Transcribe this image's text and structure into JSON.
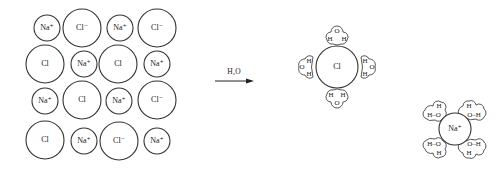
{
  "figure": {
    "lattice": {
      "rows": [
        [
          {
            "label": "Na⁺",
            "kind": "small"
          },
          {
            "label": "Cl⁻",
            "kind": "big"
          },
          {
            "label": "Na⁺",
            "kind": "small"
          },
          {
            "label": "Cl⁻",
            "kind": "big"
          }
        ],
        [
          {
            "label": "Cl",
            "kind": "big"
          },
          {
            "label": "Na⁺",
            "kind": "small"
          },
          {
            "label": "Cl",
            "kind": "big"
          },
          {
            "label": "Na⁺",
            "kind": "small"
          }
        ],
        [
          {
            "label": "Na⁺",
            "kind": "small"
          },
          {
            "label": "Cl",
            "kind": "big"
          },
          {
            "label": "Na⁺",
            "kind": "small"
          },
          {
            "label": "Cl⁻",
            "kind": "big"
          }
        ],
        [
          {
            "label": "Cl",
            "kind": "big"
          },
          {
            "label": "Na⁺",
            "kind": "small"
          },
          {
            "label": "Cl⁻",
            "kind": "big"
          },
          {
            "label": "Na⁺",
            "kind": "small"
          }
        ]
      ]
    },
    "arrow": {
      "label": "H₂O"
    },
    "hydrated_chloride": {
      "ion_label": "Cl",
      "waters": [
        {
          "position": "top",
          "atoms": [
            "H",
            "O",
            "H"
          ]
        },
        {
          "position": "left",
          "atoms": [
            "H",
            "O",
            "H"
          ]
        },
        {
          "position": "right",
          "atoms": [
            "H",
            "O",
            "H"
          ]
        },
        {
          "position": "bottom",
          "atoms": [
            "H",
            "O",
            "H"
          ]
        }
      ]
    },
    "hydrated_sodium": {
      "ion_label": "Na⁺",
      "waters": [
        {
          "position": "top-left",
          "text_top": "H",
          "text_bottom": "H–O"
        },
        {
          "position": "top-right",
          "text_top": "H",
          "text_bottom": "O–H"
        },
        {
          "position": "bottom-left",
          "text_top": "H–O",
          "text_bottom": "H"
        },
        {
          "position": "bottom-right",
          "text_top": "O–H",
          "text_bottom": "H"
        }
      ]
    },
    "atom_labels": {
      "H": "H",
      "O": "O"
    }
  }
}
